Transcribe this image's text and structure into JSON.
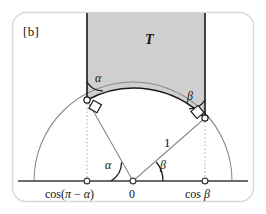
{
  "figure": {
    "panel_label": "[b]",
    "region_label": "T",
    "radius_label": "1",
    "origin_label": "0",
    "left_tick_label_text": "cos(π − α)",
    "left_tick_label_prefix": "cos(",
    "left_tick_label_pi": "π",
    "left_tick_label_minus": " − ",
    "left_tick_label_alpha": "α",
    "left_tick_label_suffix": ")",
    "right_tick_label_prefix": "cos ",
    "right_tick_label_beta": "β",
    "angle_alpha_top": "α",
    "angle_beta_top": "β",
    "angle_alpha_center": "α",
    "angle_beta_center": "β",
    "colors": {
      "shaded_region_fill": "#cfcfcf",
      "stroke_dark": "#1a1a1a",
      "stroke_light": "#8a8a8a",
      "dotted_guide": "#b0b0b0",
      "frame_border": "#d8d8d8",
      "background": "#ffffff",
      "marker_fill": "#ffffff"
    },
    "geometry": {
      "origin_x": 133,
      "origin_y": 181,
      "radius": 99,
      "left_tangent_x": 87,
      "left_tangent_y": 100,
      "right_tangent_x": 205,
      "right_tangent_y": 118,
      "baseline_y": 181,
      "shaded_top_y": 16
    }
  }
}
